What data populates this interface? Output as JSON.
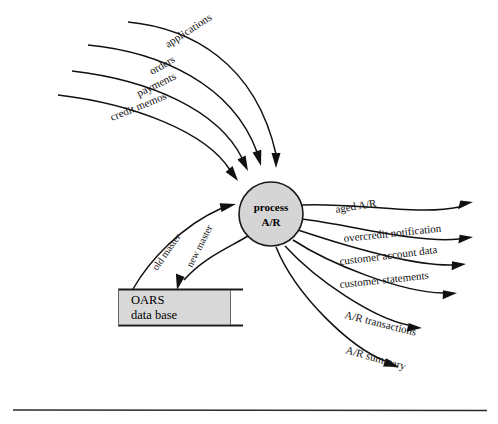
{
  "diagram": {
    "type": "data-flow-diagram",
    "process": {
      "id": "process-ar",
      "label_line1": "process",
      "label_line2": "A/R",
      "shape": "circle",
      "fill_color": "#d5d5d5",
      "stroke_color": "#1a1a1a",
      "center_x": 271,
      "center_y": 214,
      "radius": 32
    },
    "data_store": {
      "id": "oars-data-base",
      "label_line1": "OARS",
      "label_line2": "data base",
      "fill_color": "#d8d8d8",
      "stroke_color": "#1a1a1a",
      "x": 118,
      "y": 289,
      "width": 115,
      "height": 36
    },
    "inputs": [
      {
        "label": "applications",
        "rotate": -33,
        "label_x": 168,
        "label_y": 48
      },
      {
        "label": "orders",
        "rotate": -30,
        "label_x": 152,
        "label_y": 75
      },
      {
        "label": "payments",
        "rotate": -26,
        "label_x": 139,
        "label_y": 97
      },
      {
        "label": "credit memos",
        "rotate": -22,
        "label_x": 112,
        "label_y": 121
      }
    ],
    "outputs": [
      {
        "label": "aged A/R",
        "rotate": -9,
        "label_x": 336,
        "label_y": 213
      },
      {
        "label": "overcredit notification",
        "rotate": -6,
        "label_x": 344,
        "label_y": 242
      },
      {
        "label": "customer account data",
        "rotate": -7,
        "label_x": 340,
        "label_y": 265
      },
      {
        "label": "customer statements",
        "rotate": -6,
        "label_x": 340,
        "label_y": 288
      },
      {
        "label": "A/R transactions",
        "rotate": 14,
        "label_x": 344,
        "label_y": 318
      },
      {
        "label": "A/R summary",
        "rotate": 16,
        "label_x": 345,
        "label_y": 353
      }
    ],
    "store_flows": [
      {
        "label": "old master",
        "direction": "store-to-process",
        "rotate": -55,
        "label_x": 157,
        "label_y": 271
      },
      {
        "label": "new master",
        "direction": "process-to-store",
        "rotate": -63,
        "label_x": 192,
        "label_y": 268
      }
    ],
    "footer_rule": {
      "x1": 13,
      "x2": 487,
      "y": 410
    }
  }
}
